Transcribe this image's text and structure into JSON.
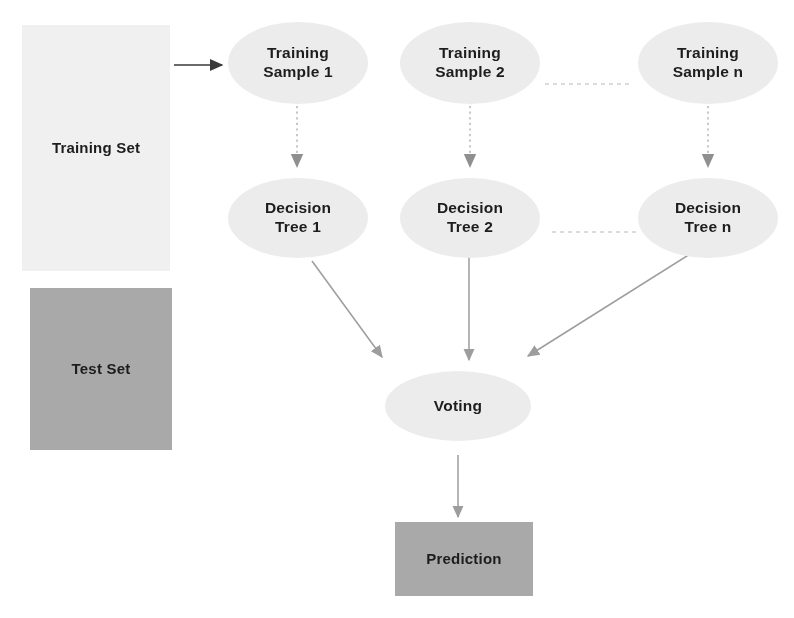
{
  "diagram": {
    "colors": {
      "training_set_fill": "#f0f0f0",
      "test_set_fill": "#a9a9a9",
      "ellipse_fill": "#ececec",
      "prediction_fill": "#a9a9a9",
      "text": "#1d1d1d",
      "solid_arrow": "#3a3a3a",
      "gray_arrow": "#9a9a9a",
      "dotted_arrow": "#b4b4b4",
      "dotted_connector": "#c8c8c8"
    },
    "nodes": {
      "training_set": {
        "label": "Training Set",
        "shape": "rect"
      },
      "test_set": {
        "label": "Test Set",
        "shape": "rect"
      },
      "training_sample_1": {
        "label": "Training\nSample 1",
        "shape": "ellipse"
      },
      "training_sample_2": {
        "label": "Training\nSample 2",
        "shape": "ellipse"
      },
      "training_sample_n": {
        "label": "Training\nSample n",
        "shape": "ellipse"
      },
      "decision_tree_1": {
        "label": "Decision\nTree 1",
        "shape": "ellipse"
      },
      "decision_tree_2": {
        "label": "Decision\nTree 2",
        "shape": "ellipse"
      },
      "decision_tree_n": {
        "label": "Decision\nTree n",
        "shape": "ellipse"
      },
      "voting": {
        "label": "Voting",
        "shape": "ellipse"
      },
      "prediction": {
        "label": "Prediction",
        "shape": "rect"
      }
    },
    "edges": [
      {
        "from": "training_set",
        "to": "training_sample_1",
        "style": "solid-dark"
      },
      {
        "from": "training_sample_1",
        "to": "decision_tree_1",
        "style": "dotted"
      },
      {
        "from": "training_sample_2",
        "to": "decision_tree_2",
        "style": "dotted"
      },
      {
        "from": "training_sample_n",
        "to": "decision_tree_n",
        "style": "dotted"
      },
      {
        "from": "training_sample_2",
        "to": "training_sample_n",
        "style": "dotted-connector"
      },
      {
        "from": "decision_tree_2",
        "to": "decision_tree_n",
        "style": "dotted-connector"
      },
      {
        "from": "decision_tree_1",
        "to": "voting",
        "style": "solid-gray"
      },
      {
        "from": "decision_tree_2",
        "to": "voting",
        "style": "solid-gray"
      },
      {
        "from": "decision_tree_n",
        "to": "voting",
        "style": "solid-gray"
      },
      {
        "from": "voting",
        "to": "prediction",
        "style": "solid-gray"
      }
    ]
  }
}
